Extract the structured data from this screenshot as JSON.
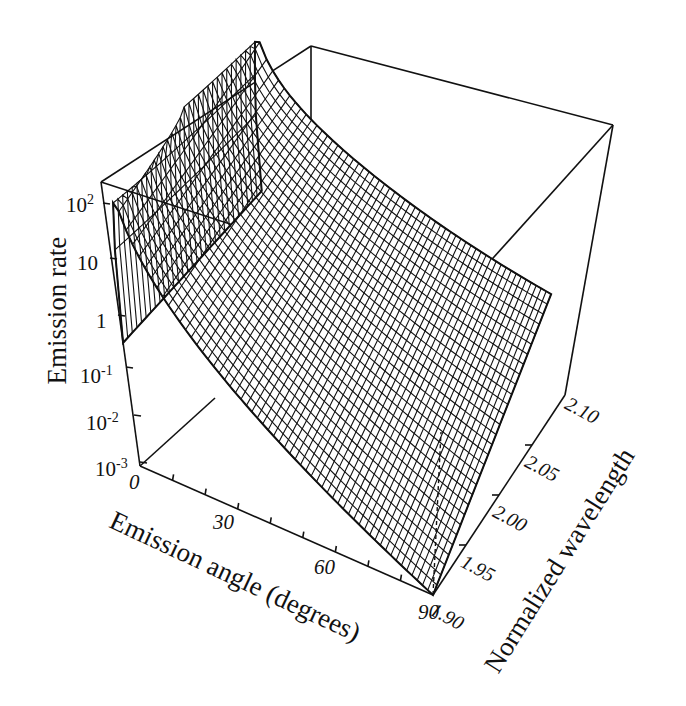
{
  "chart_data": {
    "type": "surface3d",
    "title": "",
    "xlabel": "Emission angle (degrees)",
    "ylabel": "Normalized wavelength",
    "zlabel": "Emission rate",
    "x_ticks": [
      "0",
      "30",
      "60",
      "90"
    ],
    "x_range": [
      0,
      90
    ],
    "y_ticks": [
      "1.90",
      "1.95",
      "2.00",
      "2.05",
      "2.10"
    ],
    "y_range": [
      1.9,
      2.1
    ],
    "z_ticks": [
      {
        "base": "10",
        "exp": "2",
        "value": 100
      },
      {
        "base": "10",
        "exp": "",
        "value": 10
      },
      {
        "base": "1",
        "exp": "",
        "value": 1
      },
      {
        "base": "10",
        "exp": "-1",
        "value": 0.1
      },
      {
        "base": "10",
        "exp": "-2",
        "value": 0.01
      },
      {
        "base": "10",
        "exp": "-3",
        "value": 0.001
      }
    ],
    "z_scale": "log",
    "z_range": [
      0.001,
      200
    ],
    "grid": false,
    "surface_description": "Wireframe mesh surface: emission rate peaks (~200) near angle 0-5 deg at low normalized wavelength (~1.90), drops sharply to ~0.2 at angle 0 along the near edge, and decays toward ~0.001-0.1 at 90 degrees and at 2.10 wavelength; a dashed line marks ~1.90 at 90 deg rising to the surface.",
    "approx_points": [
      {
        "angle": 0,
        "wavelength": 1.9,
        "rate": 0.2
      },
      {
        "angle": 5,
        "wavelength": 1.9,
        "rate": 200
      },
      {
        "angle": 30,
        "wavelength": 1.9,
        "rate": 0.05
      },
      {
        "angle": 60,
        "wavelength": 1.9,
        "rate": 0.003
      },
      {
        "angle": 90,
        "wavelength": 1.9,
        "rate": 0.001
      },
      {
        "angle": 0,
        "wavelength": 2.1,
        "rate": 30
      },
      {
        "angle": 90,
        "wavelength": 2.1,
        "rate": 0.1
      }
    ]
  },
  "labels": {
    "zlabel": "Emission rate",
    "xlabel": "Emission angle (degrees)",
    "ylabel": "Normalized wavelength"
  },
  "colors": {
    "ink": "#111111",
    "background": "#ffffff"
  }
}
